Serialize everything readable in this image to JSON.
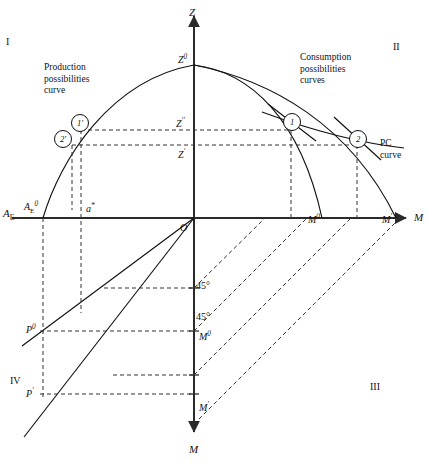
{
  "figure": {
    "type": "four-quadrant-economic-diagram",
    "quadrants": [
      {
        "id": "I",
        "label": "I",
        "x": 6,
        "y": 36
      },
      {
        "id": "II",
        "label": "II",
        "x": 393,
        "y": 41
      },
      {
        "id": "III",
        "label": "III",
        "x": 370,
        "y": 381
      },
      {
        "id": "IV",
        "label": "IV",
        "x": 10,
        "y": 375
      }
    ],
    "annotations": [
      {
        "name": "production-possibilities-curve-label",
        "lines": [
          "Production",
          "possibilities",
          "curve"
        ],
        "x": 44,
        "y": 62
      },
      {
        "name": "consumption-possibilities-curves-label",
        "lines": [
          "Consumption",
          "possibilities",
          "curves"
        ],
        "x": 300,
        "y": 52
      },
      {
        "name": "pc-curve-label",
        "lines": [
          "PC",
          "curve"
        ],
        "x": 380,
        "y": 138
      }
    ],
    "axes": [
      {
        "name": "z-axis",
        "label": "Z",
        "label_x": 189,
        "label_y": 6,
        "italic": true
      },
      {
        "name": "m-axis-right",
        "label": "M",
        "label_x": 414,
        "label_y": 211,
        "italic": true
      },
      {
        "name": "m-axis-down",
        "label": "M",
        "label_x": 189,
        "label_y": 443,
        "italic": true
      },
      {
        "name": "ae-axis-left",
        "label": "A",
        "sub": "E",
        "label_x": 3,
        "label_y": 207,
        "italic": true
      }
    ],
    "axis_ticks": [
      {
        "name": "tick-z0",
        "base": "Z",
        "sup": "0",
        "x": 178,
        "y": 53,
        "axis": "z"
      },
      {
        "name": "tick-z2",
        "base": "Z",
        "sup": "′′",
        "x": 176,
        "y": 117,
        "axis": "z"
      },
      {
        "name": "tick-z1",
        "base": "Z",
        "sup": "′",
        "x": 178,
        "y": 148,
        "axis": "z"
      },
      {
        "name": "tick-ae0",
        "base": "A",
        "sub": "E",
        "sup": "0",
        "x": 24,
        "y": 200,
        "axis": "ae"
      },
      {
        "name": "tick-a-star",
        "base": "a",
        "sup": "*",
        "x": 86,
        "y": 202,
        "axis": "ae"
      },
      {
        "name": "tick-m0-right",
        "base": "M",
        "sup": "0",
        "x": 308,
        "y": 213,
        "axis": "m-right"
      },
      {
        "name": "tick-m1-right",
        "base": "M",
        "sup": "′",
        "x": 382,
        "y": 213,
        "axis": "m-right"
      },
      {
        "name": "tick-m0-down",
        "base": "M",
        "sup": "0",
        "x": 199,
        "y": 330,
        "axis": "m-down"
      },
      {
        "name": "tick-m1-down",
        "base": "M",
        "sup": "′",
        "x": 199,
        "y": 401,
        "axis": "m-down"
      },
      {
        "name": "tick-p0",
        "base": "P",
        "sup": "0",
        "x": 26,
        "y": 323,
        "axis": "p"
      },
      {
        "name": "tick-p1",
        "base": "P",
        "sup": "′",
        "x": 26,
        "y": 387,
        "axis": "p"
      },
      {
        "name": "angle-label-1",
        "base": "45°",
        "x": 196,
        "y": 280,
        "axis": "m-down"
      },
      {
        "name": "angle-label-2",
        "base": "45°",
        "x": 196,
        "y": 311,
        "axis": "m-down"
      },
      {
        "name": "origin",
        "base": "O",
        "x": 180,
        "y": 222,
        "axis": "origin"
      }
    ],
    "markers": [
      {
        "name": "marker-1-prime",
        "label": "1′",
        "cx": 79,
        "cy": 122,
        "r": 8
      },
      {
        "name": "marker-2-prime",
        "label": "2′",
        "cx": 62,
        "cy": 138,
        "r": 8
      },
      {
        "name": "marker-1",
        "label": "1",
        "cx": 291,
        "cy": 121,
        "r": 8
      },
      {
        "name": "marker-2",
        "label": "2",
        "cx": 357,
        "cy": 138,
        "r": 8
      }
    ],
    "colors": {
      "ink": "#111111",
      "axis": "#2a2a2a",
      "dashed": "#333333"
    }
  },
  "chart_data": {
    "type": "line",
    "origin": {
      "x": 194,
      "y": 218
    },
    "axis_ranges": {
      "z_top": 14,
      "m_right": 412,
      "m_bottom": 436,
      "ae_left": 14
    },
    "curves": [
      {
        "name": "production-possibilities-curve",
        "quadrant": "I",
        "style": "solid",
        "path": "M 43 218 C 60 160, 110 80, 194 65"
      },
      {
        "name": "consumption-possibilities-curve-outer",
        "quadrant": "II",
        "style": "solid",
        "path": "M 194 65 C 250 72, 300 118, 322 218"
      },
      {
        "name": "consumption-possibilities-curve-inner",
        "quadrant": "II",
        "style": "solid",
        "path": "M 194 65 C 270 80, 350 124, 396 218"
      },
      {
        "name": "pc-curve",
        "quadrant": "II",
        "style": "solid",
        "path": "M 262 112 C 300 126, 350 142, 404 148"
      },
      {
        "name": "tangent-line-at-point-1",
        "quadrant": "II",
        "style": "solid",
        "path": "M 268 104 L 316 141"
      },
      {
        "name": "tangent-line-at-point-2",
        "quadrant": "II",
        "style": "solid",
        "path": "M 334 117 L 381 160"
      },
      {
        "name": "ray-through-p0",
        "quadrant": "IV",
        "style": "solid",
        "path": "M 194 218 L 22 346"
      },
      {
        "name": "ray-through-p1",
        "quadrant": "IV",
        "style": "solid",
        "path": "M 194 218 L 24 437"
      }
    ],
    "dashed_connectors": [
      {
        "name": "z2-level-line",
        "path": "M 81 130 L 291 130"
      },
      {
        "name": "z1-level-line",
        "path": "M 72 145 L 357 145"
      },
      {
        "name": "drop-1-prime",
        "path": "M 81 130 L 81 313"
      },
      {
        "name": "drop-2-prime",
        "path": "M 72 145 L 72 210"
      },
      {
        "name": "drop-a-star",
        "path": "M 43 218 L 43 398"
      },
      {
        "name": "drop-point-1",
        "path": "M 291 130 L 291 218"
      },
      {
        "name": "drop-point-2",
        "path": "M 357 145 L 357 218"
      },
      {
        "name": "iv-level-p0",
        "path": "M 40 331 L 194 331"
      },
      {
        "name": "iv-level-upper",
        "path": "M 104 288 L 194 288"
      },
      {
        "name": "iv-level-lower",
        "path": "M 113 375 L 194 375"
      },
      {
        "name": "iv-level-p1",
        "path": "M 40 394 L 194 394"
      },
      {
        "name": "iii-diag-1",
        "path": "M 194 288 L 265 218"
      },
      {
        "name": "iii-diag-2",
        "path": "M 194 331 L 307 218"
      },
      {
        "name": "iii-diag-3",
        "path": "M 194 375 L 351 218"
      },
      {
        "name": "iii-diag-4",
        "path": "M 194 424 L 400 218"
      }
    ]
  }
}
